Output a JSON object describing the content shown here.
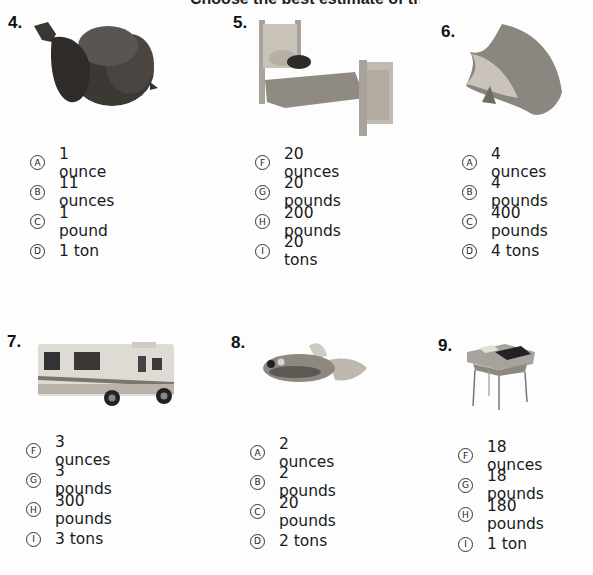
{
  "page": {
    "cutoff_heading": "Choose the best estimate of the weight of each object.",
    "background_color": "#fdfdfd",
    "text_color": "#1a1a1a"
  },
  "problems": [
    {
      "number": "4.",
      "image_icon": "acorn-image",
      "options": [
        {
          "letter": "A",
          "text": "1 ounce"
        },
        {
          "letter": "B",
          "text": "11 ounces"
        },
        {
          "letter": "C",
          "text": "1 pound"
        },
        {
          "letter": "D",
          "text": "1 ton"
        }
      ]
    },
    {
      "number": "5.",
      "image_icon": "bed-image",
      "options": [
        {
          "letter": "F",
          "text": "20 ounces"
        },
        {
          "letter": "G",
          "text": "20 pounds"
        },
        {
          "letter": "H",
          "text": "200 pounds"
        },
        {
          "letter": "I",
          "text": "20 tons"
        }
      ]
    },
    {
      "number": "6.",
      "image_icon": "seashell-image",
      "options": [
        {
          "letter": "A",
          "text": "4 ounces"
        },
        {
          "letter": "B",
          "text": "4 pounds"
        },
        {
          "letter": "C",
          "text": "400 pounds"
        },
        {
          "letter": "D",
          "text": "4 tons"
        }
      ]
    },
    {
      "number": "7.",
      "image_icon": "motorhome-image",
      "options": [
        {
          "letter": "F",
          "text": "3 ounces"
        },
        {
          "letter": "G",
          "text": "3 pounds"
        },
        {
          "letter": "H",
          "text": "300 pounds"
        },
        {
          "letter": "I",
          "text": "3 tons"
        }
      ]
    },
    {
      "number": "8.",
      "image_icon": "goldfish-image",
      "options": [
        {
          "letter": "A",
          "text": "2 ounces"
        },
        {
          "letter": "B",
          "text": "2 pounds"
        },
        {
          "letter": "C",
          "text": "20 pounds"
        },
        {
          "letter": "D",
          "text": "2 tons"
        }
      ]
    },
    {
      "number": "9.",
      "image_icon": "school-desk-image",
      "options": [
        {
          "letter": "F",
          "text": "18 ounces"
        },
        {
          "letter": "G",
          "text": "18 pounds"
        },
        {
          "letter": "H",
          "text": "180 pounds"
        },
        {
          "letter": "I",
          "text": "1 ton"
        }
      ]
    }
  ]
}
